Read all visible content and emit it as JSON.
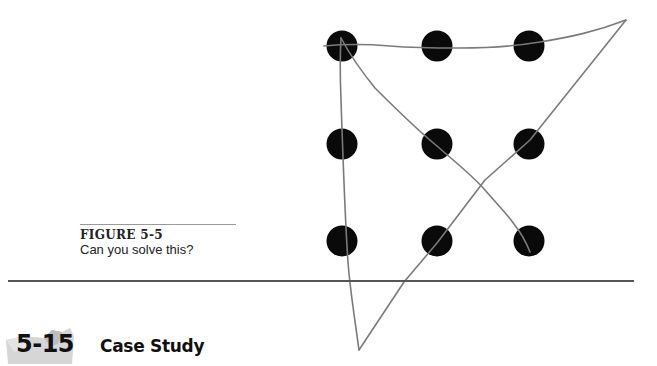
{
  "figure": {
    "label": "FIGURE 5-5",
    "caption": "Can you solve this?",
    "dot_color": "#0a0a0a",
    "line_color": "#7a7a7a",
    "dots": [
      {
        "row": 1,
        "col": 1,
        "cx": 342,
        "cy": 46
      },
      {
        "row": 1,
        "col": 2,
        "cx": 437,
        "cy": 46
      },
      {
        "row": 1,
        "col": 3,
        "cx": 529,
        "cy": 46
      },
      {
        "row": 2,
        "col": 1,
        "cx": 342,
        "cy": 144
      },
      {
        "row": 2,
        "col": 2,
        "cx": 437,
        "cy": 144
      },
      {
        "row": 2,
        "col": 3,
        "cx": 529,
        "cy": 144
      },
      {
        "row": 3,
        "col": 1,
        "cx": 342,
        "cy": 241
      },
      {
        "row": 3,
        "col": 2,
        "cx": 437,
        "cy": 241
      },
      {
        "row": 3,
        "col": 3,
        "cx": 529,
        "cy": 241
      }
    ]
  },
  "section": {
    "number": "5-15",
    "title": "Case Study"
  }
}
